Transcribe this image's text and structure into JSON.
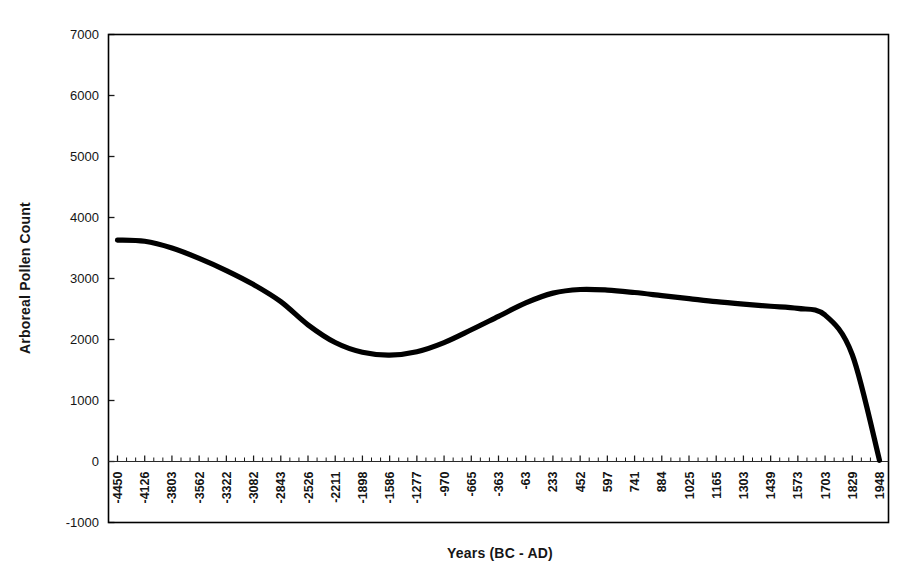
{
  "chart_data": {
    "type": "line",
    "title": "",
    "xlabel": "Years (BC - AD)",
    "ylabel": "Arboreal Pollen Count",
    "grid": false,
    "legend": "none",
    "ylim": [
      -1000,
      7000
    ],
    "y_ticks": [
      7000,
      6000,
      5000,
      4000,
      3000,
      2000,
      1000,
      0,
      -1000
    ],
    "y_tick_labels": [
      "7000",
      "6000",
      "5000",
      "4000",
      "3000",
      "2000",
      "1000",
      "0",
      "-1000"
    ],
    "x_axis_type": "category",
    "categories": [
      "-4450",
      "-4126",
      "-3803",
      "-3562",
      "-3322",
      "-3082",
      "-2843",
      "-2526",
      "-2211",
      "-1898",
      "-1586",
      "-1277",
      "-970",
      "-665",
      "-363",
      "-63",
      "233",
      "452",
      "597",
      "741",
      "884",
      "1025",
      "1165",
      "1303",
      "1439",
      "1573",
      "1703",
      "1829",
      "1948"
    ],
    "series": [
      {
        "name": "Arboreal Pollen Count",
        "color": "#000000",
        "values": [
          3630,
          3610,
          3500,
          3330,
          3130,
          2900,
          2620,
          2240,
          1950,
          1790,
          1745,
          1800,
          1950,
          2160,
          2380,
          2600,
          2760,
          2820,
          2810,
          2770,
          2720,
          2670,
          2620,
          2580,
          2545,
          2510,
          2400,
          1750,
          20
        ]
      }
    ],
    "annotations": {
      "start_value": 3630,
      "trough_value": 1745,
      "trough_category": "-1586",
      "peak_value": 2820,
      "peak_category": "452",
      "end_value": 20,
      "end_category": "1948"
    },
    "minor_ticks_per_interval": 2
  },
  "axes": {
    "y_title": "Arboreal Pollen Count",
    "x_title": "Years (BC - AD)"
  }
}
